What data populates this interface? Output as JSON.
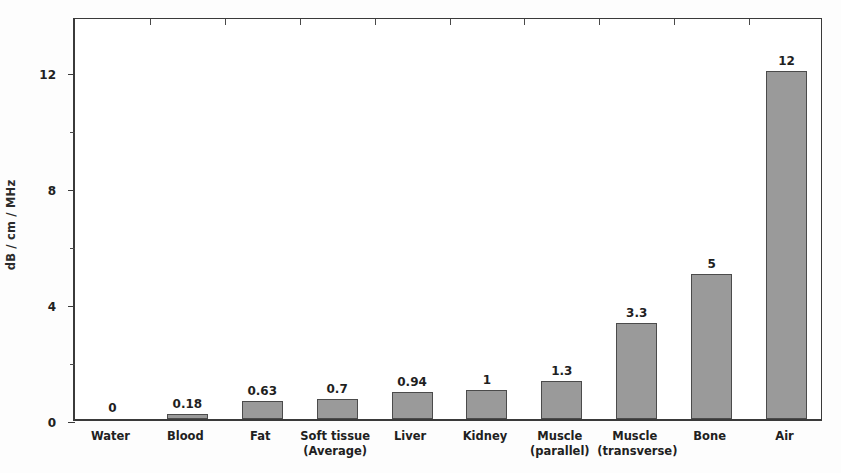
{
  "chart_data": {
    "type": "bar",
    "title": "",
    "xlabel": "",
    "ylabel": "dB / cm / MHz",
    "ylim": [
      0,
      13.9
    ],
    "yticks": [
      0,
      4,
      8,
      12
    ],
    "yticklabels": [
      "0",
      "4",
      "8",
      "12"
    ],
    "yminorticks": [
      2,
      6,
      10
    ],
    "grid": false,
    "legend": false,
    "bar_color": "#9a9a9a",
    "bar_edge_color": "#4b4b4b",
    "categories": [
      "Water",
      "Blood",
      "Fat",
      "Soft tissue\n(Average)",
      "Liver",
      "Kidney",
      "Muscle\n(parallel)",
      "Muscle\n(transverse)",
      "Bone",
      "Air"
    ],
    "values": [
      0,
      0.18,
      0.63,
      0.7,
      0.94,
      1,
      1.3,
      3.3,
      5,
      12
    ],
    "value_labels": [
      "0",
      "0.18",
      "0.63",
      "0.7",
      "0.94",
      "1",
      "1.3",
      "3.3",
      "5",
      "12"
    ]
  }
}
